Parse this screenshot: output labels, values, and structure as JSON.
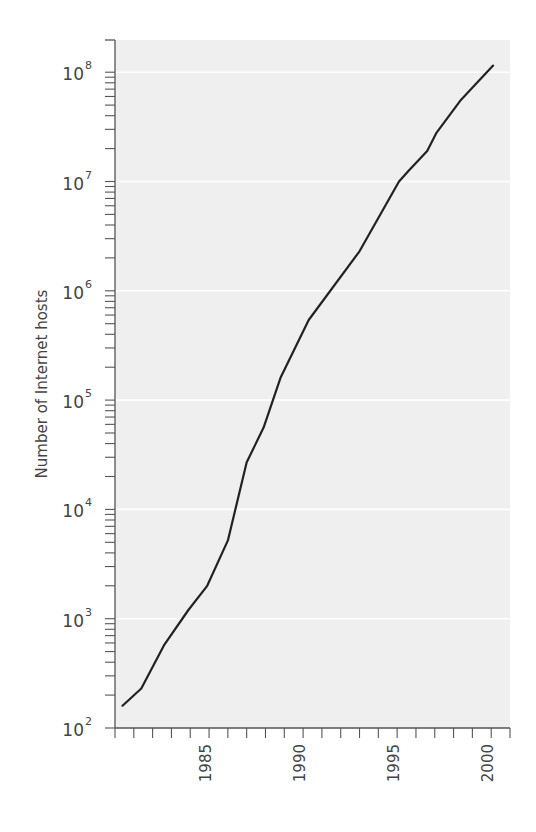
{
  "chart_data": {
    "type": "line",
    "title": "",
    "xlabel": "",
    "ylabel": "Number of Internet hosts",
    "yscale": "log",
    "ylim": [
      100,
      200000000
    ],
    "xlim": [
      1980.2,
      2001.2
    ],
    "grid": {
      "horizontal": true,
      "vertical": false,
      "style": "white lines on light gray background"
    },
    "legend": null,
    "x_tick_labels": [
      "1985",
      "1990",
      "1995",
      "2000"
    ],
    "x_tick_values": [
      1985,
      1990,
      1995,
      2000
    ],
    "x_minor_tick_step": 1,
    "y_tick_labels": [
      {
        "base": "10",
        "exp": "2",
        "value": 100
      },
      {
        "base": "10",
        "exp": "3",
        "value": 1000
      },
      {
        "base": "10",
        "exp": "4",
        "value": 10000
      },
      {
        "base": "10",
        "exp": "5",
        "value": 100000
      },
      {
        "base": "10",
        "exp": "6",
        "value": 1000000
      },
      {
        "base": "10",
        "exp": "7",
        "value": 10000000
      },
      {
        "base": "10",
        "exp": "8",
        "value": 100000000
      }
    ],
    "series": [
      {
        "name": "Internet hosts",
        "color": "#222222",
        "x": [
          1980.6,
          1981.6,
          1982.8,
          1984.1,
          1985.1,
          1986.2,
          1987.2,
          1988.1,
          1989.0,
          1990.5,
          1993.2,
          1995.3,
          1995.8,
          1996.8,
          1997.3,
          1998.6,
          2000.3
        ],
        "y": [
          160,
          230,
          570,
          1200,
          2000,
          5200,
          27000,
          56000,
          160000,
          540000,
          2300000,
          10000000,
          12500000,
          19000000,
          28000000,
          56000000,
          115000000
        ]
      }
    ]
  },
  "colors": {
    "plot_background": "#efefef",
    "gridline": "#ffffff",
    "axis": "#555555",
    "line": "#222222",
    "text": "#444444"
  }
}
